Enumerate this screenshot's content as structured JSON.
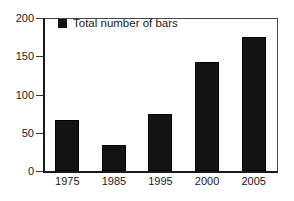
{
  "chart_data": {
    "type": "bar",
    "title": "",
    "subtitle": "",
    "xlabel": "",
    "ylabel": "",
    "categories": [
      "1975",
      "1985",
      "1995",
      "2000",
      "2005"
    ],
    "values": [
      67,
      34,
      75,
      143,
      175
    ],
    "series": [
      {
        "name": "Total number of bars",
        "values": [
          67,
          34,
          75,
          143,
          175
        ],
        "color": "#141414"
      }
    ],
    "ylim": [
      0,
      200
    ],
    "yticks": [
      0,
      50,
      100,
      150,
      200
    ],
    "ytick_labels": [
      "0",
      "50",
      "100",
      "150",
      "200"
    ],
    "grid": false,
    "legend": {
      "position": "top-left-inside",
      "entries": [
        {
          "label": "Total number of bars",
          "marker": "filled-square",
          "color": "#141414"
        }
      ]
    },
    "frame": {
      "border_color": "#4a4a4a",
      "axis_color": "#1a1a1a",
      "background": "#ffffff"
    }
  }
}
